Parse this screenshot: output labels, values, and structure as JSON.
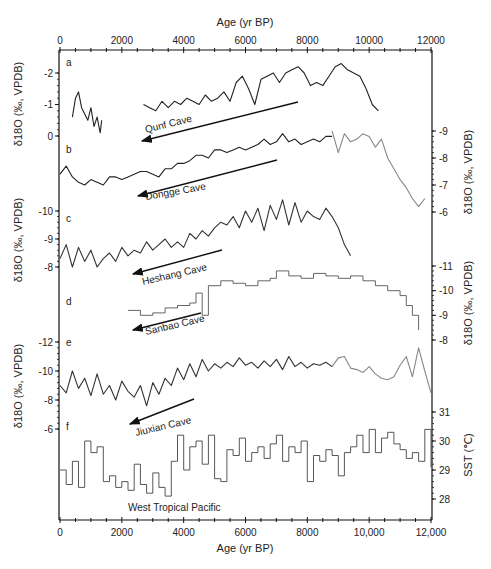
{
  "chart_data": {
    "type": "line",
    "title": "",
    "x_axis": {
      "label_top": "Age (yr BP)",
      "label_bottom": "Age (yr BP)",
      "range": [
        0,
        12000
      ],
      "ticks_top": [
        "0",
        "2000",
        "4000",
        "6000",
        "8000",
        "10000",
        "12000"
      ],
      "ticks_bottom": [
        "0",
        "2000",
        "4000",
        "6000",
        "8000",
        "10,000",
        "12,000"
      ],
      "tick_values": [
        0,
        2000,
        4000,
        6000,
        8000,
        10000,
        12000
      ]
    },
    "panels": [
      {
        "letter": "a",
        "name": "Qunf Cave",
        "axis_side": "left",
        "ylabel": "δ18O (‰, VPDB)",
        "yticks": [
          "-2",
          "-1",
          "0"
        ],
        "ytick_values": [
          -2,
          -1,
          0
        ],
        "color": "#222222",
        "series": [
          {
            "x": [
              400,
              500,
              600,
              700,
              800,
              900,
              1000,
              1100,
              1200,
              1300,
              1350
            ],
            "y": [
              -0.6,
              -1.2,
              -1.4,
              -0.9,
              -0.7,
              -0.5,
              -0.9,
              -0.3,
              -0.6,
              -0.1,
              -0.5
            ]
          },
          {
            "x": [
              2700,
              2900,
              3100,
              3300,
              3500,
              3700,
              3900,
              4100,
              4300,
              4500,
              4700,
              4900,
              5100,
              5300,
              5500,
              5700,
              5900,
              6100,
              6300,
              6500,
              6700,
              6900,
              7100,
              7300,
              7500,
              7700,
              7900,
              8100,
              8300,
              8500,
              8700,
              8900,
              9100,
              9300,
              9500,
              9700,
              9900,
              10100,
              10300
            ],
            "y": [
              -1.0,
              -0.9,
              -0.8,
              -1.1,
              -0.9,
              -1.1,
              -1.0,
              -1.2,
              -1.1,
              -1.0,
              -1.3,
              -1.1,
              -1.2,
              -1.4,
              -1.1,
              -1.7,
              -1.9,
              -1.5,
              -1.0,
              -1.8,
              -1.9,
              -2.0,
              -1.7,
              -2.0,
              -2.1,
              -2.2,
              -2.0,
              -1.6,
              -1.7,
              -1.6,
              -1.9,
              -2.2,
              -2.3,
              -2.1,
              -2.0,
              -1.9,
              -1.5,
              -1.0,
              -0.8
            ]
          }
        ]
      },
      {
        "letter": "b",
        "name": "Dongge Cave",
        "axis_side": "right",
        "ylabel": "δ18O (‰, VPDB)",
        "yticks": [
          "-9",
          "-8",
          "-7",
          "-6"
        ],
        "ytick_values": [
          -9,
          -8,
          -7,
          -6
        ],
        "color": "#222222",
        "series": [
          {
            "x": [
              0,
              200,
              400,
              600,
              800,
              1000,
              1200,
              1400,
              1600,
              1800,
              2000,
              2200,
              2400,
              2600,
              2800,
              3000,
              3200,
              3400,
              3600,
              3800,
              4000,
              4200,
              4400,
              4600,
              4800,
              5000,
              5200,
              5400,
              5600,
              5800,
              6000,
              6200,
              6400,
              6600,
              6800,
              7000,
              7200,
              7400,
              7600,
              7800,
              8000,
              8200,
              8400,
              8600,
              8800
            ],
            "y": [
              -7.4,
              -7.7,
              -7.3,
              -7.1,
              -7.0,
              -7.2,
              -7.1,
              -7.0,
              -7.3,
              -7.3,
              -7.2,
              -7.3,
              -7.4,
              -7.5,
              -7.5,
              -7.4,
              -7.3,
              -7.6,
              -7.6,
              -7.8,
              -7.8,
              -7.9,
              -8.1,
              -8.1,
              -8.0,
              -8.3,
              -8.3,
              -8.2,
              -8.3,
              -8.4,
              -8.3,
              -8.4,
              -8.5,
              -8.7,
              -8.5,
              -8.6,
              -8.9,
              -8.6,
              -8.7,
              -8.5,
              -8.6,
              -8.7,
              -8.6,
              -8.8,
              -8.8
            ]
          },
          {
            "x": [
              8800,
              9000,
              9200,
              9400,
              9600,
              9800,
              10000,
              10200,
              10400,
              10600,
              10800,
              11000,
              11200,
              11400,
              11600,
              11800
            ],
            "y": [
              -9.0,
              -8.2,
              -8.9,
              -8.6,
              -8.7,
              -8.9,
              -8.8,
              -8.4,
              -8.7,
              -8.0,
              -7.6,
              -7.2,
              -6.9,
              -6.5,
              -6.2,
              -6.5
            ]
          }
        ]
      },
      {
        "letter": "c",
        "name": "Heshang Cave",
        "axis_side": "left",
        "ylabel": "δ18O (‰, VPDB)",
        "yticks": [
          "-10",
          "-9",
          "-8"
        ],
        "ytick_values": [
          -10,
          -9,
          -8
        ],
        "color": "#333333",
        "series": [
          {
            "x": [
              0,
              200,
              400,
              600,
              800,
              1000,
              1200,
              1400,
              1600,
              1800,
              2000,
              2200,
              2400,
              2600,
              2800,
              3000,
              3200,
              3400,
              3600,
              3800,
              4000,
              4200,
              4400,
              4600,
              4800,
              5000,
              5200,
              5400,
              5600,
              5800,
              6000,
              6200,
              6400,
              6600,
              6800,
              7000,
              7200,
              7400,
              7600,
              7800,
              8000,
              8200,
              8400,
              8600,
              8800,
              9000,
              9200,
              9400
            ],
            "y": [
              -8.3,
              -8.8,
              -8.0,
              -8.7,
              -8.2,
              -8.6,
              -8.0,
              -8.3,
              -8.5,
              -8.2,
              -8.7,
              -8.4,
              -8.6,
              -8.5,
              -8.9,
              -8.6,
              -8.8,
              -9.0,
              -8.7,
              -8.9,
              -8.7,
              -9.2,
              -9.0,
              -9.3,
              -9.1,
              -9.4,
              -9.6,
              -9.5,
              -9.8,
              -9.4,
              -10.0,
              -9.6,
              -10.1,
              -9.3,
              -10.2,
              -9.7,
              -10.4,
              -9.5,
              -10.3,
              -9.6,
              -10.0,
              -9.8,
              -9.7,
              -10.1,
              -9.8,
              -9.4,
              -8.8,
              -8.4
            ]
          }
        ]
      },
      {
        "letter": "d",
        "name": "Sanbao Cave",
        "axis_side": "right",
        "ylabel": "δ18O (‰, VPDB)",
        "yticks": [
          "-11",
          "-10",
          "-9",
          "-8"
        ],
        "ytick_values": [
          -11,
          -10,
          -9,
          -8
        ],
        "color": "#555555",
        "step": true,
        "series": [
          {
            "x": [
              2200,
              2600,
              3000,
              3400,
              3800,
              4200,
              4400,
              4600,
              4800,
              5200,
              5600,
              6000,
              6400,
              6800,
              7000,
              7400,
              7800,
              8200,
              8600,
              9000,
              9400,
              9800,
              10200,
              10600,
              11000,
              11200,
              11400,
              11600
            ],
            "y": [
              -9.2,
              -9.0,
              -9.1,
              -9.3,
              -9.4,
              -9.5,
              -9.9,
              -9.0,
              -10.2,
              -10.4,
              -10.3,
              -10.2,
              -10.4,
              -10.5,
              -10.8,
              -10.6,
              -10.5,
              -10.7,
              -10.6,
              -10.5,
              -10.6,
              -10.4,
              -10.2,
              -10.0,
              -9.8,
              -9.4,
              -9.0,
              -8.4
            ]
          }
        ]
      },
      {
        "letter": "e",
        "name": "Jiuxian Cave",
        "axis_side": "left",
        "ylabel": "δ18O (‰, VPDB)",
        "yticks": [
          "-12",
          "-10",
          "-8",
          "-6"
        ],
        "ytick_values": [
          -12,
          -10,
          -8,
          -6
        ],
        "color": "#333333",
        "series": [
          {
            "x": [
              0,
              200,
              400,
              600,
              800,
              1000,
              1200,
              1400,
              1600,
              1800,
              2000,
              2200,
              2400,
              2600,
              2800,
              3000,
              3200,
              3400,
              3600,
              3800,
              4000,
              4200,
              4400,
              4600,
              4800,
              5000,
              5200,
              5400,
              5600,
              5800,
              6000,
              6200,
              6400,
              6600,
              6800,
              7000,
              7200,
              7400,
              7600,
              7800,
              8000,
              8200,
              8400,
              8600,
              8800
            ],
            "y": [
              -9.0,
              -8.5,
              -10.0,
              -8.8,
              -9.5,
              -8.3,
              -9.8,
              -8.4,
              -9.0,
              -8.0,
              -9.3,
              -8.6,
              -8.2,
              -9.0,
              -7.6,
              -9.2,
              -8.4,
              -9.5,
              -9.0,
              -10.2,
              -9.4,
              -10.5,
              -9.6,
              -10.8,
              -10.0,
              -10.5,
              -10.2,
              -10.6,
              -10.3,
              -10.9,
              -10.4,
              -10.6,
              -10.2,
              -10.7,
              -10.3,
              -10.8,
              -10.1,
              -11.0,
              -10.3,
              -10.6,
              -10.2,
              -10.5,
              -10.4,
              -10.6,
              -10.3
            ]
          },
          {
            "x": [
              8800,
              9000,
              9200,
              9400,
              9600,
              9800,
              10000,
              10200,
              10400,
              10600,
              10800,
              11000,
              11200,
              11400,
              11600,
              11800,
              12000
            ],
            "y": [
              -10.3,
              -10.9,
              -11.0,
              -10.2,
              -10.1,
              -9.9,
              -10.3,
              -9.8,
              -9.5,
              -9.4,
              -9.6,
              -10.4,
              -11.0,
              -9.6,
              -11.6,
              -10.0,
              -8.5
            ]
          }
        ]
      },
      {
        "letter": "f",
        "name": "West Tropical Pacific",
        "axis_side": "right",
        "ylabel": "SST (℃)",
        "yticks": [
          "31",
          "30",
          "29",
          "28"
        ],
        "ytick_values": [
          31,
          30,
          29,
          28
        ],
        "color": "#444444",
        "step": true,
        "series": [
          {
            "x": [
              0,
              200,
              400,
              600,
              800,
              1000,
              1200,
              1400,
              1600,
              1800,
              2000,
              2200,
              2400,
              2600,
              2800,
              3000,
              3200,
              3400,
              3600,
              3800,
              4000,
              4200,
              4400,
              4600,
              4800,
              5000,
              5200,
              5400,
              5600,
              5800,
              6000,
              6200,
              6400,
              6600,
              6800,
              7000,
              7200,
              7400,
              7600,
              7800,
              8000,
              8200,
              8400,
              8600,
              8800,
              9000,
              9200,
              9400,
              9600,
              9800,
              10000,
              10200,
              10400,
              10600,
              10800,
              11000,
              11200,
              11400,
              11600,
              11800,
              12000
            ],
            "y": [
              29.0,
              28.5,
              29.3,
              28.4,
              30.0,
              29.6,
              29.8,
              28.6,
              28.8,
              28.4,
              28.6,
              28.3,
              29.2,
              28.5,
              28.2,
              28.9,
              28.4,
              28.1,
              29.3,
              30.2,
              29.0,
              29.8,
              30.0,
              29.2,
              30.2,
              28.7,
              28.6,
              29.7,
              29.5,
              30.1,
              29.3,
              29.6,
              29.8,
              29.4,
              29.9,
              30.2,
              29.3,
              29.8,
              29.6,
              30.0,
              28.6,
              29.5,
              29.3,
              29.7,
              29.5,
              28.8,
              29.6,
              29.8,
              30.2,
              29.6,
              30.4,
              29.6,
              30.1,
              30.3,
              29.9,
              29.7,
              29.4,
              29.6,
              29.3,
              30.4,
              29.1
            ]
          }
        ]
      }
    ],
    "annotations": [
      "Qunf Cave",
      "Dongge Cave",
      "Heshang Cave",
      "Sanbao Cave",
      "Jiuxian Cave",
      "West Tropical Pacific"
    ]
  }
}
